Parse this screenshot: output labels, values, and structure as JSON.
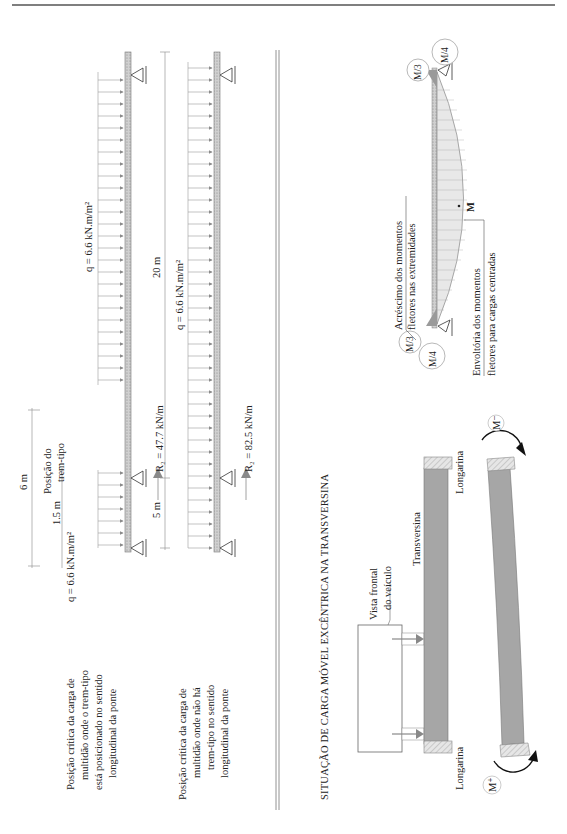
{
  "page": {
    "orientation": "rotated-90-ccw",
    "header_rule_color": "#555555"
  },
  "colors": {
    "beam_fill": "#c8c8c8",
    "load_arrow": "#8a8a8a",
    "dim_line": "#9a9a9a",
    "transversina_fill": "#a6a6a6",
    "longarina_fill": "#e2e2e2",
    "moment_arrow": "#111111",
    "text": "#222222"
  },
  "diagram1": {
    "caption": [
      "Posição crítica da carga de",
      "multidão onde o trem-tipo",
      "está posicionado no sentido",
      "longitudinal da ponte"
    ],
    "load_left": "q = 6.6 kN.m/m²",
    "load_right": "q = 6.6 kN.m/m²",
    "dim_total": "6 m",
    "dim_offset": "1.5 m",
    "trem_label": [
      "Posição do",
      "trem-tipo"
    ],
    "reaction": "R₂ = 47.7 kN/m"
  },
  "diagram2": {
    "caption": [
      "Posição crítica da carga de",
      "multidão onde não há",
      "trem-tipo no sentido",
      "longitudinal da ponte"
    ],
    "load": "q = 6.6 kN.m/m²",
    "dim_left": "5 m",
    "dim_total": "20 m",
    "reaction": "R₂ = 82.5 kN/m"
  },
  "section": {
    "title": "SITUAÇÃO DE CARGA MÓVEL EXCÊNTRICA NA TRANSVERSINA"
  },
  "moment_diagram": {
    "top_labels": [
      "M/3",
      "M/4"
    ],
    "bottom_labels": [
      "M/3",
      "M/4"
    ],
    "mid_label": "M",
    "note_extremes": [
      "Acréscimo dos momentos",
      "fletores nas extremidades"
    ],
    "note_envelope": [
      "Envoltória dos momentos",
      "fletores para cargas centradas"
    ]
  },
  "transversina": {
    "vehicle_label": [
      "Vista frontal",
      "do veículo"
    ],
    "beam_label": "Transversina",
    "longarina_top": "Longarina",
    "longarina_bottom": "Longarina",
    "moment_neg": "M⁻",
    "moment_pos": "M⁺"
  }
}
